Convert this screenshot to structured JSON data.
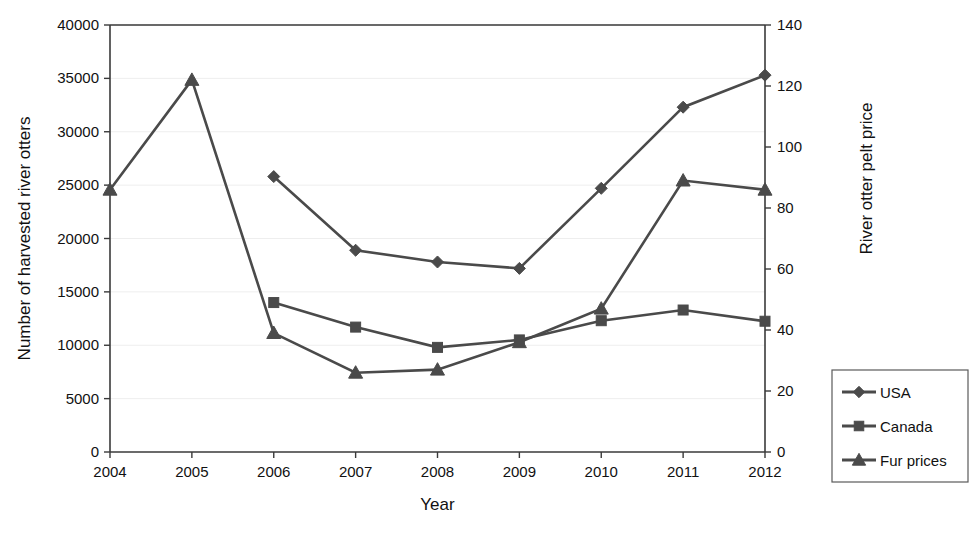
{
  "chart_data": {
    "type": "line",
    "title": "",
    "xlabel": "Year",
    "ylabel": "Number of harvested river otters",
    "y2label": "River otter pelt price",
    "categories": [
      2004,
      2005,
      2006,
      2007,
      2008,
      2009,
      2010,
      2011,
      2012
    ],
    "xlim": [
      2004,
      2012
    ],
    "ylim": [
      0,
      40000
    ],
    "y2lim": [
      0,
      140
    ],
    "yticks": [
      0,
      5000,
      10000,
      15000,
      20000,
      25000,
      30000,
      35000,
      40000
    ],
    "y2ticks": [
      0,
      20,
      40,
      60,
      80,
      100,
      120,
      140
    ],
    "xticks": [
      "2004",
      "2005",
      "2006",
      "2007",
      "2008",
      "2009",
      "2010",
      "2011",
      "2012"
    ],
    "ytick_labels": [
      "0",
      "5000",
      "10000",
      "15000",
      "20000",
      "25000",
      "30000",
      "35000",
      "40000"
    ],
    "y2tick_labels": [
      "0",
      "20",
      "40",
      "60",
      "80",
      "100",
      "120",
      "140"
    ],
    "grid": true,
    "legend_position": "right-outside",
    "series": [
      {
        "name": "USA",
        "axis": "left",
        "marker": "diamond",
        "color": "#4a4a4a",
        "x": [
          2006,
          2007,
          2008,
          2009,
          2010,
          2011,
          2012
        ],
        "values": [
          25800,
          18900,
          17800,
          17200,
          24700,
          32300,
          35300
        ]
      },
      {
        "name": "Canada",
        "axis": "left",
        "marker": "square",
        "color": "#4a4a4a",
        "x": [
          2006,
          2007,
          2008,
          2009,
          2010,
          2011,
          2012
        ],
        "values": [
          14000,
          11700,
          9800,
          10500,
          12300,
          13300,
          12250
        ]
      },
      {
        "name": "Fur prices",
        "axis": "right",
        "marker": "triangle",
        "color": "#4a4a4a",
        "x": [
          2004,
          2005,
          2006,
          2007,
          2008,
          2009,
          2010,
          2011,
          2012
        ],
        "values": [
          86,
          122,
          39,
          26,
          27,
          36,
          47,
          89,
          86
        ]
      }
    ]
  },
  "axes": {
    "x_title": "Year",
    "y_left_title": "Number of harvested river otters",
    "y_right_title": "River otter pelt price"
  },
  "legend": {
    "entries": [
      {
        "label": "USA",
        "marker": "diamond"
      },
      {
        "label": "Canada",
        "marker": "square"
      },
      {
        "label": "Fur prices",
        "marker": "triangle"
      }
    ]
  },
  "colors": {
    "line": "#4a4a4a",
    "axis": "#3a3a3a",
    "grid": "#eeeeee",
    "text": "#111111",
    "background": "#ffffff"
  }
}
